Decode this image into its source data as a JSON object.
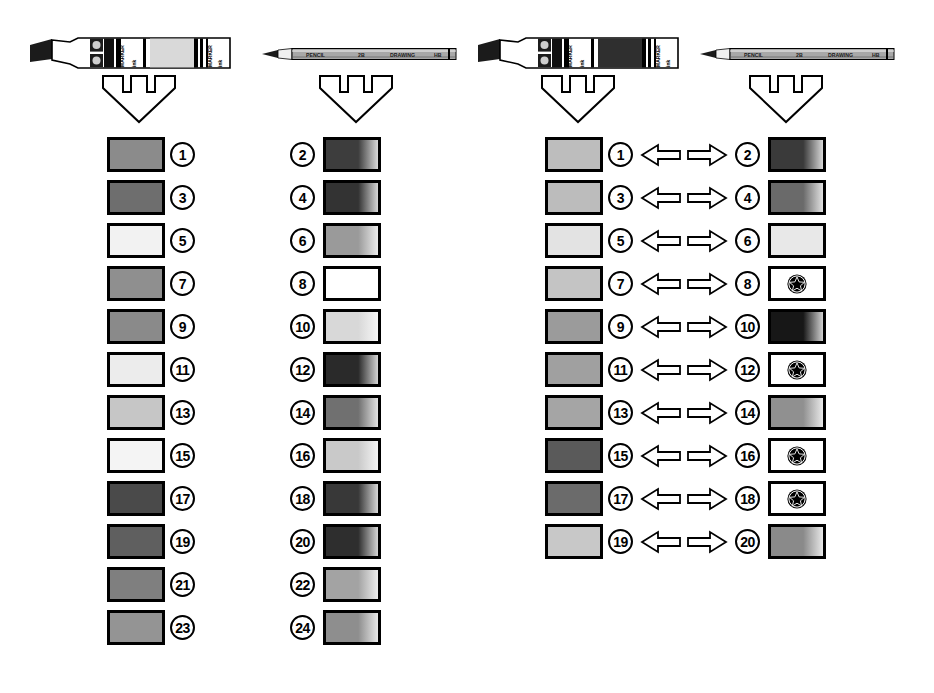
{
  "page": {
    "background": "#ffffff",
    "ink": "#000000"
  },
  "instruments": [
    {
      "id": "marker-left",
      "type": "marker",
      "label": "marker-chisel-tip",
      "brand_text": "MARKER",
      "orientation": "tip-left",
      "x": 30,
      "y": 36
    },
    {
      "id": "pencil-left",
      "type": "pencil",
      "label": "sharpened-pencil",
      "brand_text": "PENCIL",
      "orientation": "tip-left",
      "x": 262,
      "y": 46
    },
    {
      "id": "marker-right",
      "type": "marker",
      "label": "marker-chisel-tip",
      "brand_text": "MARKER",
      "orientation": "tip-left",
      "x": 478,
      "y": 36
    },
    {
      "id": "pencil-right",
      "type": "pencil",
      "label": "sharpened-pencil",
      "brand_text": "PENCIL",
      "orientation": "tip-left",
      "x": 700,
      "y": 46
    }
  ],
  "down_arrows": [
    {
      "id": "down-arrow-1",
      "x": 101,
      "y": 74
    },
    {
      "id": "down-arrow-2",
      "x": 318,
      "y": 74
    },
    {
      "id": "down-arrow-3",
      "x": 540,
      "y": 74
    },
    {
      "id": "down-arrow-4",
      "x": 748,
      "y": 74
    }
  ],
  "left_block": {
    "name": "left-comparison-block",
    "has_bidirectional_arrows": false,
    "row_start_y": 137,
    "row_pitch": 43,
    "columns": {
      "swatch_a_x": 107,
      "number_a_x": 170,
      "number_b_x": 290,
      "swatch_b_x": 323
    },
    "rows": [
      {
        "a": {
          "number": "1",
          "fill": "#8b8b8b",
          "gradient": false,
          "star": false
        },
        "b": {
          "number": "2",
          "fill": "#3d3d3d",
          "gradient": true,
          "star": false
        }
      },
      {
        "a": {
          "number": "3",
          "fill": "#6e6e6e",
          "gradient": false,
          "star": false
        },
        "b": {
          "number": "4",
          "fill": "#333333",
          "gradient": true,
          "star": false
        }
      },
      {
        "a": {
          "number": "5",
          "fill": "#f2f2f2",
          "gradient": false,
          "star": false
        },
        "b": {
          "number": "6",
          "fill": "#9a9a9a",
          "gradient": true,
          "star": false
        }
      },
      {
        "a": {
          "number": "7",
          "fill": "#8f8f8f",
          "gradient": false,
          "star": false
        },
        "b": {
          "number": "8",
          "fill": "#ffffff",
          "gradient": false,
          "star": false
        }
      },
      {
        "a": {
          "number": "9",
          "fill": "#8a8a8a",
          "gradient": false,
          "star": false
        },
        "b": {
          "number": "10",
          "fill": "#d8d8d8",
          "gradient": true,
          "star": false
        }
      },
      {
        "a": {
          "number": "11",
          "fill": "#ececec",
          "gradient": false,
          "star": false
        },
        "b": {
          "number": "12",
          "fill": "#2a2a2a",
          "gradient": true,
          "star": false
        }
      },
      {
        "a": {
          "number": "13",
          "fill": "#c6c6c6",
          "gradient": false,
          "star": false
        },
        "b": {
          "number": "14",
          "fill": "#707070",
          "gradient": true,
          "star": false
        }
      },
      {
        "a": {
          "number": "15",
          "fill": "#f4f4f4",
          "gradient": false,
          "star": false
        },
        "b": {
          "number": "16",
          "fill": "#c9c9c9",
          "gradient": true,
          "star": false
        }
      },
      {
        "a": {
          "number": "17",
          "fill": "#4a4a4a",
          "gradient": false,
          "star": false
        },
        "b": {
          "number": "18",
          "fill": "#383838",
          "gradient": true,
          "star": false
        }
      },
      {
        "a": {
          "number": "19",
          "fill": "#5f5f5f",
          "gradient": false,
          "star": false
        },
        "b": {
          "number": "20",
          "fill": "#2e2e2e",
          "gradient": true,
          "star": false
        }
      },
      {
        "a": {
          "number": "21",
          "fill": "#7f7f7f",
          "gradient": false,
          "star": false
        },
        "b": {
          "number": "22",
          "fill": "#a3a3a3",
          "gradient": true,
          "star": false
        }
      },
      {
        "a": {
          "number": "23",
          "fill": "#949494",
          "gradient": false,
          "star": false
        },
        "b": {
          "number": "24",
          "fill": "#8e8e8e",
          "gradient": true,
          "star": false
        }
      }
    ]
  },
  "right_block": {
    "name": "right-comparison-block",
    "has_bidirectional_arrows": true,
    "row_start_y": 137,
    "row_pitch": 43,
    "columns": {
      "swatch_a_x": 545,
      "number_a_x": 608,
      "arrow_x": 640,
      "number_b_x": 735,
      "swatch_b_x": 768
    },
    "arrow_symbol": "bidirectional-arrow",
    "rows": [
      {
        "a": {
          "number": "1",
          "fill": "#bdbdbd",
          "gradient": false,
          "star": false
        },
        "b": {
          "number": "2",
          "fill": "#3a3a3a",
          "gradient": true,
          "star": false
        }
      },
      {
        "a": {
          "number": "3",
          "fill": "#bcbcbc",
          "gradient": false,
          "star": false
        },
        "b": {
          "number": "4",
          "fill": "#6a6a6a",
          "gradient": true,
          "star": false
        }
      },
      {
        "a": {
          "number": "5",
          "fill": "#e3e3e3",
          "gradient": false,
          "star": false
        },
        "b": {
          "number": "6",
          "fill": "#e8e8e8",
          "gradient": false,
          "star": false
        }
      },
      {
        "a": {
          "number": "7",
          "fill": "#c4c4c4",
          "gradient": false,
          "star": false
        },
        "b": {
          "number": "8",
          "fill": "#ffffff",
          "gradient": false,
          "star": true
        }
      },
      {
        "a": {
          "number": "9",
          "fill": "#9b9b9b",
          "gradient": false,
          "star": false
        },
        "b": {
          "number": "10",
          "fill": "#171717",
          "gradient": true,
          "star": false
        }
      },
      {
        "a": {
          "number": "11",
          "fill": "#a0a0a0",
          "gradient": false,
          "star": false
        },
        "b": {
          "number": "12",
          "fill": "#ffffff",
          "gradient": false,
          "star": true
        }
      },
      {
        "a": {
          "number": "13",
          "fill": "#a5a5a5",
          "gradient": false,
          "star": false
        },
        "b": {
          "number": "14",
          "fill": "#909090",
          "gradient": true,
          "star": false
        }
      },
      {
        "a": {
          "number": "15",
          "fill": "#5a5a5a",
          "gradient": false,
          "star": false
        },
        "b": {
          "number": "16",
          "fill": "#ffffff",
          "gradient": false,
          "star": true
        }
      },
      {
        "a": {
          "number": "17",
          "fill": "#6b6b6b",
          "gradient": false,
          "star": false
        },
        "b": {
          "number": "18",
          "fill": "#ffffff",
          "gradient": false,
          "star": true
        }
      },
      {
        "a": {
          "number": "19",
          "fill": "#c8c8c8",
          "gradient": false,
          "star": false
        },
        "b": {
          "number": "20",
          "fill": "#8a8a8a",
          "gradient": true,
          "star": false
        }
      }
    ]
  }
}
